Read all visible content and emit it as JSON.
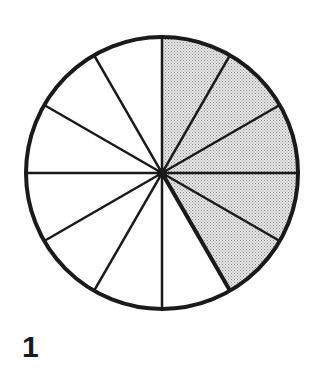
{
  "figure": {
    "label": "1",
    "total_sectors": 12,
    "shaded_sectors": 5,
    "shaded_start_index": 0,
    "center": [
      162,
      173
    ],
    "radius": 136,
    "colors": {
      "stroke": "#1a1a1a",
      "shade": "#cfcfcf",
      "fill": "#ffffff"
    }
  }
}
